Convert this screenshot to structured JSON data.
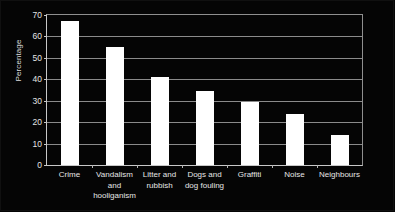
{
  "chart_data": {
    "type": "bar",
    "title": "",
    "xlabel": "",
    "ylabel": "Percentage",
    "ylim": [
      0,
      70
    ],
    "yticks": [
      0,
      10,
      20,
      30,
      40,
      50,
      60,
      70
    ],
    "ytick_labels": [
      "0",
      "10",
      "20",
      "30",
      "40",
      "50",
      "60",
      "70"
    ],
    "grid": true,
    "legend": "none",
    "bar_color": "#ffffff",
    "background_color": "#000000",
    "categories": [
      "Crime",
      "Vandalism and hooliganism",
      "Litter and rubbish",
      "Dogs and dog fouling",
      "Graffiti",
      "Noise",
      "Neighbours"
    ],
    "category_label_lines": [
      [
        "Crime"
      ],
      [
        "Vandalism",
        "and",
        "hooliganism"
      ],
      [
        "Litter and",
        "rubbish"
      ],
      [
        "Dogs and",
        "dog fouling"
      ],
      [
        "Graffiti"
      ],
      [
        "Noise"
      ],
      [
        "Neighbours"
      ]
    ],
    "values": [
      67,
      55,
      41,
      34.5,
      29.5,
      24,
      14
    ]
  }
}
